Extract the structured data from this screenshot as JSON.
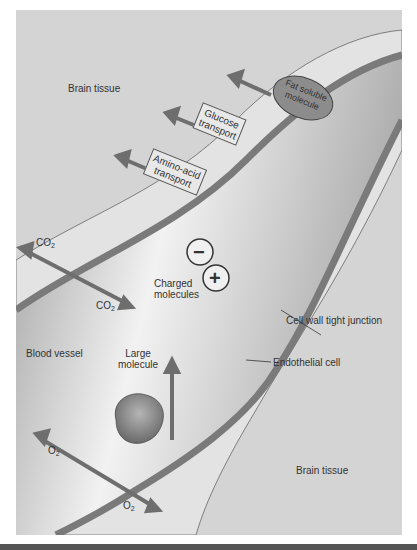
{
  "labels": {
    "brain_tissue_top": "Brain tissue",
    "brain_tissue_bottom": "Brain tissue",
    "blood_vessel": "Blood vessel",
    "fat_soluble": "Fat soluble molecule",
    "fat_soluble_line1": "Fat soluble",
    "fat_soluble_line2": "molecule",
    "glucose_line1": "Glucose",
    "glucose_line2": "transport",
    "amino_line1": "Amino-acid",
    "amino_line2": "transport",
    "co2_base": "CO",
    "co2_sub": "2",
    "o2_base": "O",
    "o2_sub": "2",
    "charged_line1": "Charged",
    "charged_line2": "molecules",
    "minus": "−",
    "plus": "+",
    "large_line1": "Large",
    "large_line2": "molecule",
    "tight_junction": "Cell wall tight junction",
    "endothelial": "Endothelial cell"
  },
  "colors": {
    "background": "#d4d4d4",
    "vessel_wall": "#7a7a7a",
    "lumen": "#bdbdbd",
    "arrow": "#6e6e6e",
    "ellipse": "#8c8c8c"
  }
}
